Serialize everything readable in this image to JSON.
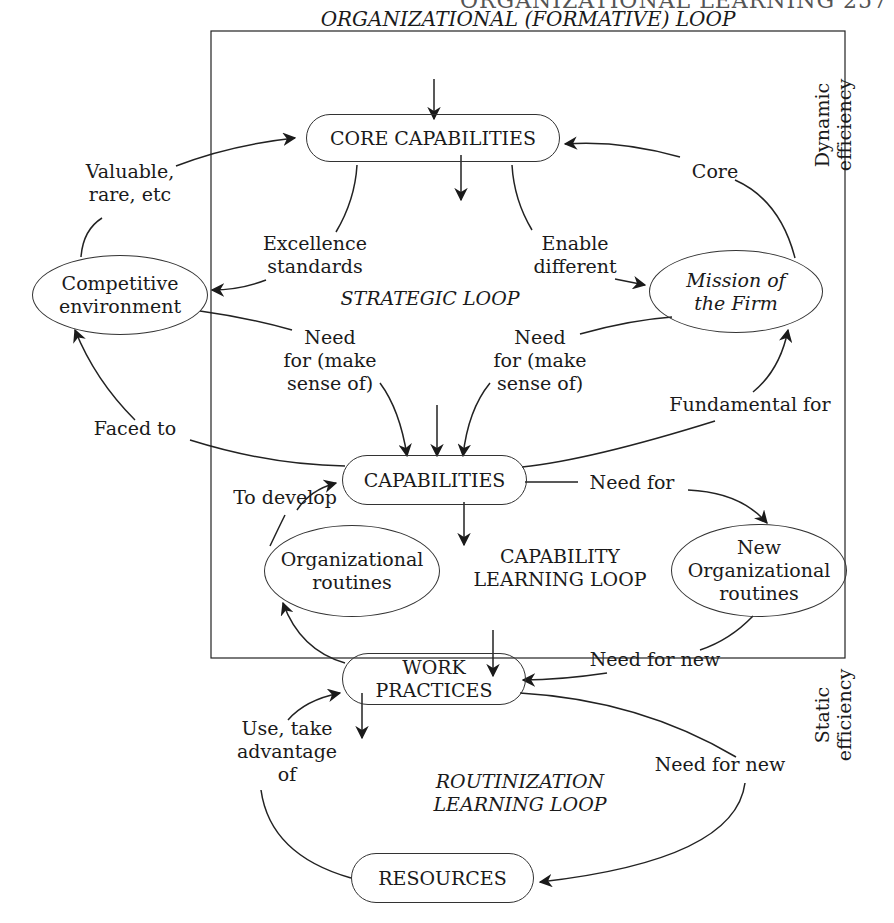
{
  "page_header": "ORGANIZATIONAL LEARNING   257",
  "frame_title": "ORGANIZATIONAL (FORMATIVE) LOOP",
  "loops": {
    "strategic": "STRATEGIC LOOP",
    "capability_l1": "CAPABILITY",
    "capability_l2": "LEARNING LOOP",
    "routinization_l1": "ROUTINIZATION",
    "routinization_l2": "LEARNING LOOP"
  },
  "side_labels": {
    "dynamic_l1": "Dynamic",
    "dynamic_l2": "efficiency",
    "static_l1": "Static",
    "static_l2": "efficiency"
  },
  "nodes": {
    "core_capabilities": "CORE CAPABILITIES",
    "competitive_l1": "Competitive",
    "competitive_l2": "environment",
    "mission_l1": "Mission of",
    "mission_l2": "the Firm",
    "capabilities": "CAPABILITIES",
    "org_routines_l1": "Organizational",
    "org_routines_l2": "routines",
    "new_routines_l1": "New",
    "new_routines_l2": "Organizational",
    "new_routines_l3": "routines",
    "work_l1": "WORK",
    "work_l2": "PRACTICES",
    "resources": "RESOURCES"
  },
  "edges": {
    "valuable_l1": "Valuable,",
    "valuable_l2": "rare, etc",
    "excellence_l1": "Excellence",
    "excellence_l2": "standards",
    "enable_l1": "Enable",
    "enable_l2": "different",
    "core": "Core",
    "needleft_l1": "Need",
    "needleft_l2": "for (make",
    "needleft_l3": "sense of)",
    "needright_l1": "Need",
    "needright_l2": "for (make",
    "needright_l3": "sense of)",
    "faced": "Faced to",
    "fundamental": "Fundamental for",
    "need_for": "Need for",
    "to_develop": "To develop",
    "need_new_1": "Need for new",
    "use_l1": "Use, take",
    "use_l2": "advantage",
    "use_l3": "of",
    "need_new_2": "Need for new"
  }
}
